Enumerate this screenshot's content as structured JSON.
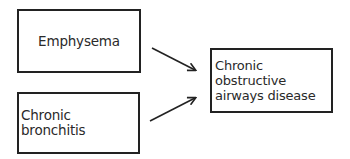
{
  "diagram": {
    "nodes": [
      {
        "id": "emphysema",
        "label": "Emphysema"
      },
      {
        "id": "chronic-bronchitis",
        "label": "Chronic bronchitis"
      },
      {
        "id": "copd",
        "label": "Chronic obstructive\nairways disease"
      }
    ],
    "edges": [
      {
        "from": "emphysema",
        "to": "copd"
      },
      {
        "from": "chronic-bronchitis",
        "to": "copd"
      }
    ],
    "colors": {
      "stroke": "#222222",
      "text": "#2a2a2a",
      "background": "#ffffff"
    }
  }
}
